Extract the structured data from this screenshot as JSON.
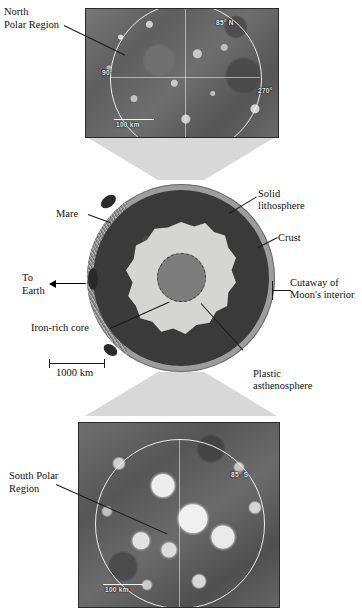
{
  "top_photo": {
    "caption_line1": "North",
    "caption_line2": "Polar Region",
    "latitude_label": "85° N",
    "longitude_label_left": "90°",
    "longitude_label_right": "270°",
    "scale_label": "100 km"
  },
  "bottom_photo": {
    "caption_line1": "South Polar",
    "caption_line2": "Region",
    "latitude_label": "85° S",
    "scale_label": "100 km"
  },
  "cutaway": {
    "labels": {
      "mare": "Mare",
      "to_earth_line1": "To",
      "to_earth_line2": "Earth",
      "iron_core": "Iron-rich core",
      "solid_lithosphere_line1": "Solid",
      "solid_lithosphere_line2": "lithosphere",
      "crust": "Crust",
      "cutaway_line1": "Cutaway of",
      "cutaway_line2": "Moon's interior",
      "asthenosphere_line1": "Plastic",
      "asthenosphere_line2": "asthenosphere"
    },
    "scale_label": "1000 km",
    "colors": {
      "crust": "#9d9d9d",
      "lithosphere": "#3a3a3a",
      "asthenosphere": "#d5d5d3",
      "core": "#7d7d7d",
      "mare": "#2a2a2a",
      "funnel": "#d8d8d8"
    }
  }
}
